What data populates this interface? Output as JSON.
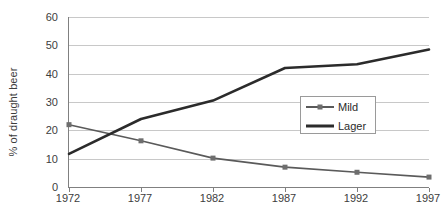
{
  "chart_data": {
    "type": "line",
    "title": "",
    "subtitle": "",
    "xlabel": "",
    "ylabel": "% of draught beer",
    "x": [
      1972,
      1977,
      1982,
      1987,
      1992,
      1997
    ],
    "categories": [
      "1972",
      "1977",
      "1982",
      "1987",
      "1992",
      "1997"
    ],
    "series": [
      {
        "name": "Mild",
        "values": [
          22,
          16.3,
          10.2,
          7,
          5.2,
          3.5
        ],
        "color": "#5a5a5a",
        "marker": "square",
        "marker_color": "#6e6e6e"
      },
      {
        "name": "Lager",
        "values": [
          11.7,
          24,
          30.5,
          42,
          43.3,
          48.5
        ],
        "color": "#2b2b2b",
        "marker": "none",
        "marker_color": "#2b2b2b"
      }
    ],
    "ylim": [
      0,
      60
    ],
    "xlim": [
      1972,
      1997
    ],
    "yticks": [
      0,
      10,
      20,
      30,
      40,
      50,
      60
    ],
    "ytick_labels": [
      "0",
      "10",
      "20",
      "30",
      "40",
      "50",
      "60"
    ],
    "xtick_labels": [
      "1972",
      "1977",
      "1982",
      "1987",
      "1992",
      "1997"
    ],
    "grid": "horizontal",
    "legend_position": "inside-right",
    "legend_entries": [
      "Mild",
      "Lager"
    ],
    "background_color": "#ffffff",
    "axis_color": "#808080",
    "gridline_color": "#c8c8c8"
  }
}
